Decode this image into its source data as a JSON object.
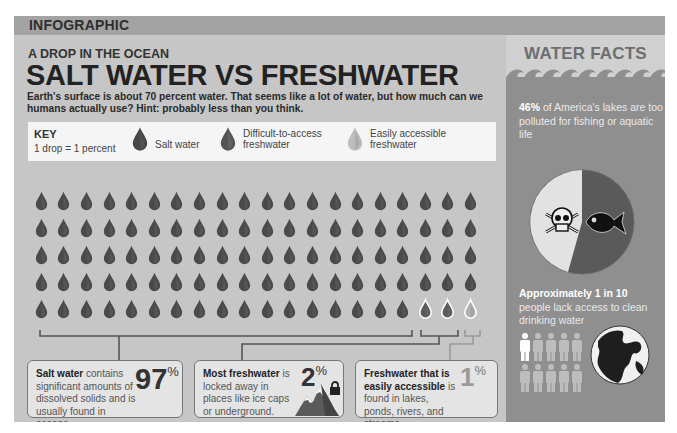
{
  "header": {
    "section_label": "INFOGRAPHIC"
  },
  "article": {
    "kicker": "A DROP IN THE OCEAN",
    "title": "SALT WATER VS FRESHWATER",
    "intro": "Earth's surface is about 70 percent water. That seems like a lot of water, but how much can we humans actually use? Hint: probably less than you think."
  },
  "key": {
    "title": "KEY",
    "subtitle": "1 drop = 1 percent",
    "items": [
      {
        "label": "Salt water",
        "icon": "drop-dark-icon"
      },
      {
        "label_line1": "Difficult-to-access",
        "label_line2": "freshwater",
        "icon": "drop-medium-icon"
      },
      {
        "label_line1": "Easily accessible",
        "label_line2": "freshwater",
        "icon": "drop-light-icon"
      }
    ]
  },
  "drop_grid": {
    "rows": 5,
    "columns": 20,
    "salt_water_drops": 97,
    "difficult_freshwater_drops": 2,
    "easy_freshwater_drops": 1
  },
  "colors": {
    "salt_drop": "#4a4a4a",
    "difficult_drop": "#5a5a5a",
    "easy_drop": "#b0b0b0",
    "background": "#c6c6c6",
    "sidebar": "#8f8f8f"
  },
  "boxes": [
    {
      "bold": "Salt water",
      "text": " contains significant amounts of dissolved solids and is usually found in oceans.",
      "value": "97",
      "unit": "%"
    },
    {
      "bold": "Most freshwater",
      "text": " is locked away in places like ice caps or underground.",
      "value": "2",
      "unit": "%"
    },
    {
      "bold": "Freshwater that is easily accessible",
      "text": " is found in lakes, ponds, rivers, and streams.",
      "value": "1",
      "unit": "%"
    }
  ],
  "sidebar": {
    "title": "WATER FACTS",
    "fact1": {
      "bold": "46%",
      "text": " of America's lakes are too polluted for fishing or aquatic life",
      "pie_percent": 46
    },
    "fact2": {
      "bold": "Approximately 1 in 10",
      "text": " people lack access to clean drinking water",
      "people_total": 10,
      "people_highlighted": 1
    }
  }
}
